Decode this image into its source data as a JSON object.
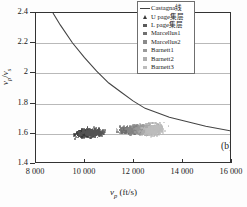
{
  "figure": {
    "panel_label": "(b)",
    "xtitle_main": "v",
    "xtitle_sub": "p",
    "xtitle_unit": " (ft/s)",
    "ytitle_num": "v",
    "ytitle_num_sub": "p",
    "ytitle_den": "v",
    "ytitle_den_sub": "s"
  },
  "axes": {
    "x_ticks": [
      "8 000",
      "10 000",
      "12 000",
      "14 000",
      "16 000"
    ],
    "x_values": [
      8000,
      10000,
      12000,
      14000,
      16000
    ],
    "y_ticks": [
      "1.4",
      "1.6",
      "1.8",
      "2",
      "2.2",
      "2.4"
    ],
    "y_values": [
      1.4,
      1.6,
      1.8,
      2.0,
      2.2,
      2.4
    ],
    "grid_y": [
      1.6,
      1.8,
      2.0,
      2.2
    ]
  },
  "legend": {
    "items": [
      {
        "label": "Castagna线",
        "marker": "line",
        "color": "#444444"
      },
      {
        "label": "U page集层",
        "marker": "triangle",
        "color": "#3a3a3a"
      },
      {
        "label": "L page集层",
        "marker": "square",
        "color": "#5a5a5a"
      },
      {
        "label": "Marcellus1",
        "marker": "square",
        "color": "#707070"
      },
      {
        "label": "Marcellus2",
        "marker": "square",
        "color": "#8a8a8a"
      },
      {
        "label": "Barnett1",
        "marker": "square",
        "color": "#9a9a9a"
      },
      {
        "label": "Barnett2",
        "marker": "square",
        "color": "#aeaeae"
      },
      {
        "label": "Barnett3",
        "marker": "square",
        "color": "#bdbdbd"
      }
    ]
  },
  "chart_data": {
    "type": "scatter",
    "title": "",
    "xlabel": "vp (ft/s)",
    "ylabel": "vp/vs",
    "xlim": [
      8000,
      16000
    ],
    "ylim": [
      1.4,
      2.4
    ],
    "grid": true,
    "legend_position": "top-right",
    "annotations": [
      {
        "text": "(b)",
        "x": 15000,
        "y": 1.47
      }
    ],
    "castagna_curve": {
      "name": "Castagna线",
      "type": "line",
      "color": "#444444",
      "x": [
        8700,
        9000,
        9500,
        10000,
        10500,
        11000,
        11500,
        12000,
        12500,
        13000,
        13500,
        14000,
        14500,
        15000,
        15500,
        16000
      ],
      "y": [
        2.4,
        2.32,
        2.2,
        2.1,
        2.01,
        1.93,
        1.87,
        1.81,
        1.76,
        1.73,
        1.7,
        1.68,
        1.66,
        1.64,
        1.625,
        1.61
      ]
    },
    "series": [
      {
        "name": "U page集层",
        "color": "#3a3a3a",
        "n": 320,
        "x_range": [
          8950,
          11600
        ],
        "y_range": [
          1.5,
          1.7
        ],
        "x_mean": 10050,
        "y_mean": 1.605
      },
      {
        "name": "L page集层",
        "color": "#555555",
        "n": 300,
        "x_range": [
          9100,
          11900
        ],
        "y_range": [
          1.52,
          1.7
        ],
        "x_mean": 10300,
        "y_mean": 1.608
      },
      {
        "name": "Marcellus1",
        "color": "#6e6e6e",
        "n": 280,
        "x_range": [
          10600,
          13100
        ],
        "y_range": [
          1.54,
          1.71
        ],
        "x_mean": 11800,
        "y_mean": 1.625
      },
      {
        "name": "Marcellus2",
        "color": "#858585",
        "n": 270,
        "x_range": [
          11000,
          13400
        ],
        "y_range": [
          1.53,
          1.72
        ],
        "x_mean": 12100,
        "y_mean": 1.628
      },
      {
        "name": "Barnett1",
        "color": "#9a9a9a",
        "n": 300,
        "x_range": [
          11300,
          13900
        ],
        "y_range": [
          1.52,
          1.73
        ],
        "x_mean": 12500,
        "y_mean": 1.63
      },
      {
        "name": "Barnett2",
        "color": "#ababab",
        "n": 260,
        "x_range": [
          11500,
          14000
        ],
        "y_range": [
          1.51,
          1.74
        ],
        "x_mean": 12700,
        "y_mean": 1.628
      },
      {
        "name": "Barnett3",
        "color": "#bcbcbc",
        "n": 240,
        "x_range": [
          11700,
          14200
        ],
        "y_range": [
          1.5,
          1.75
        ],
        "x_mean": 12800,
        "y_mean": 1.625
      }
    ]
  }
}
